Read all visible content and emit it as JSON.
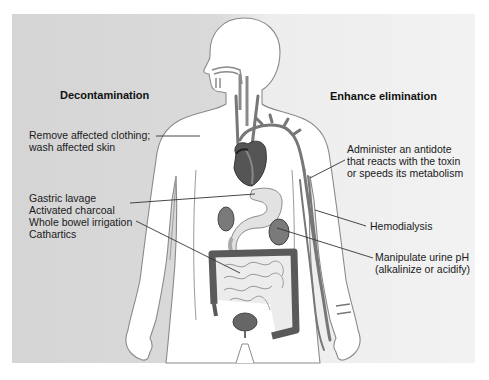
{
  "diagram": {
    "type": "anatomical-illustration",
    "colors": {
      "panel_left": "#d5d5d5",
      "panel_right": "#f1f1f1",
      "body_fill": "#ffffff",
      "outline": "#8a8a8a",
      "organ_dark": "#4a4a4a",
      "organ_mid": "#7a7a7a",
      "organ_light": "#dcdcdc",
      "leader_line": "#333333"
    }
  },
  "sections": {
    "left": {
      "heading": "Decontamination",
      "labels": [
        {
          "id": "skin",
          "lines": [
            "Remove affected clothing;",
            "wash affected skin"
          ]
        },
        {
          "id": "gi",
          "lines": [
            "Gastric lavage",
            "Activated charcoal",
            "Whole bowel irrigation",
            "Cathartics"
          ]
        }
      ]
    },
    "right": {
      "heading": "Enhance elimination",
      "labels": [
        {
          "id": "antidote",
          "lines": [
            "Administer an antidote",
            "that reacts with the toxin",
            "or speeds its metabolism"
          ]
        },
        {
          "id": "hemodialysis",
          "lines": [
            "Hemodialysis"
          ]
        },
        {
          "id": "urine",
          "lines": [
            "Manipulate urine pH",
            "(alkalinize or acidify)"
          ]
        }
      ]
    }
  }
}
